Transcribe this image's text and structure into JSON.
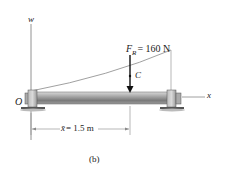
{
  "diagram": {
    "axes": {
      "vertical": "w",
      "horizontal": "x",
      "origin": "O"
    },
    "force": {
      "symbol": "F",
      "subscript": "R",
      "value_text": "= 160 N"
    },
    "centroid_label": "C",
    "dimension": {
      "symbol": "x̄",
      "value_text": "= 1.5 m"
    },
    "caption": "(b)"
  }
}
